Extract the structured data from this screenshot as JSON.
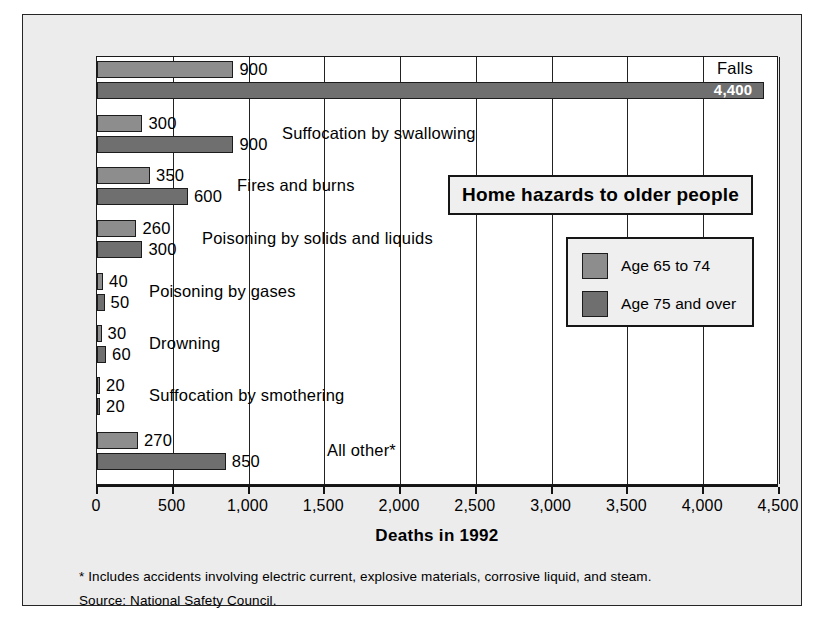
{
  "chart_data": {
    "type": "bar",
    "orientation": "horizontal",
    "title": "Home hazards to older people",
    "xlabel": "Deaths in 1992",
    "ylabel": "",
    "xlim": [
      0,
      4500
    ],
    "xticks": [
      0,
      500,
      1000,
      1500,
      2000,
      2500,
      3000,
      3500,
      4000,
      4500
    ],
    "xticklabels": [
      "0",
      "500",
      "1,000",
      "1,500",
      "2,000",
      "2,500",
      "3,000",
      "3,500",
      "4,000",
      "4,500"
    ],
    "grid": true,
    "legend_position": "right",
    "categories": [
      "Falls",
      "Suffocation by swallowing",
      "Fires and burns",
      "Poisoning by solids and liquids",
      "Poisoning by gases",
      "Drowning",
      "Suffocation by smothering",
      "All other*"
    ],
    "series": [
      {
        "name": "Age 65 to 74",
        "color": "#8d8d8d",
        "values": [
          900,
          300,
          350,
          260,
          40,
          30,
          20,
          270
        ]
      },
      {
        "name": "Age 75 and over",
        "color": "#6f6f6f",
        "values": [
          4400,
          900,
          600,
          300,
          50,
          60,
          20,
          850
        ]
      }
    ],
    "value_labels": [
      [
        "900",
        "4,400"
      ],
      [
        "300",
        "900"
      ],
      [
        "350",
        "600"
      ],
      [
        "260",
        "300"
      ],
      [
        "40",
        "50"
      ],
      [
        "30",
        "60"
      ],
      [
        "20",
        "20"
      ],
      [
        "270",
        "850"
      ]
    ],
    "footnotes": [
      "* Includes accidents involving electric current, explosive materials, corrosive liquid, and steam.",
      "Source: National Safety Council."
    ]
  },
  "colors": {
    "series_a": "#8d8d8d",
    "series_b": "#6f6f6f",
    "plot_background": "#ffffff",
    "card_background": "#ececec",
    "outline": "#1a1a1a"
  }
}
